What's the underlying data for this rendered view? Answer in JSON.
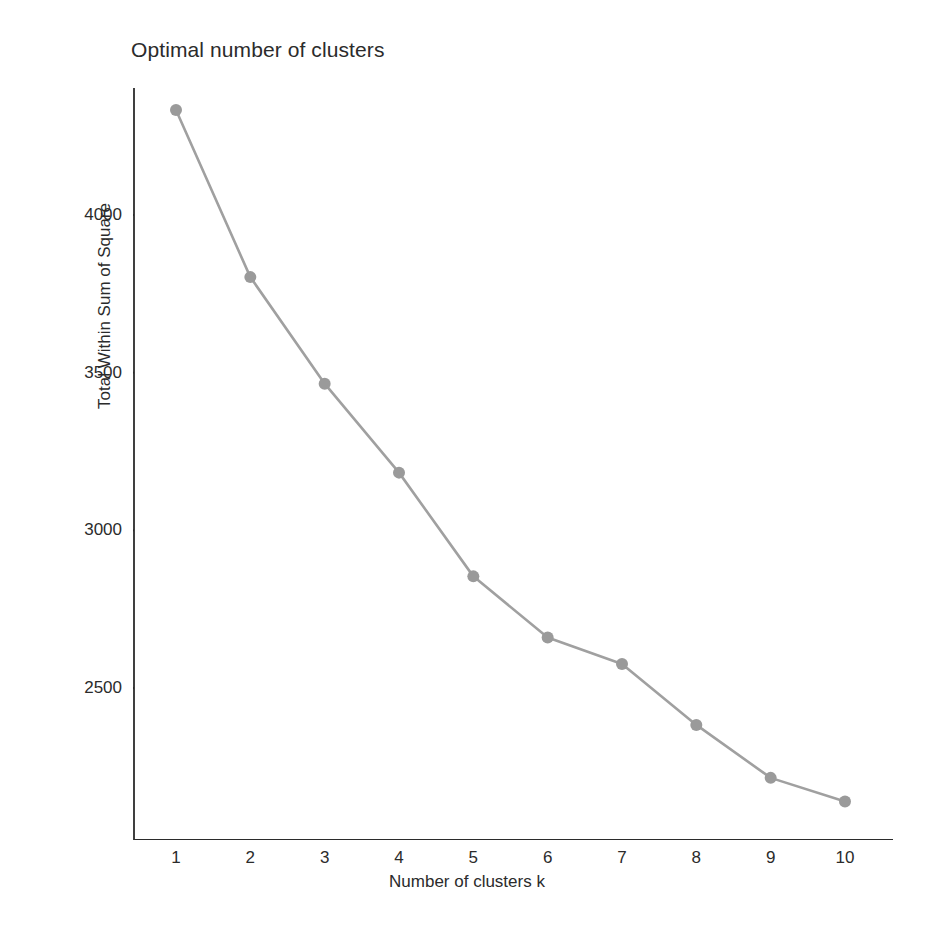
{
  "chart_data": {
    "type": "line",
    "title": "Optimal number of clusters",
    "xlabel": "Number of clusters k",
    "ylabel": "Total Within Sum of Square",
    "x": [
      1,
      2,
      3,
      4,
      5,
      6,
      7,
      8,
      9,
      10
    ],
    "categories": [
      "1",
      "2",
      "3",
      "4",
      "5",
      "6",
      "7",
      "8",
      "9",
      "10"
    ],
    "values": [
      4333,
      3803,
      3465,
      3183,
      2854,
      2660,
      2576,
      2383,
      2215,
      2140
    ],
    "series": [
      {
        "name": "Total Within Sum of Square",
        "values": [
          4333,
          3803,
          3465,
          3183,
          2854,
          2660,
          2576,
          2383,
          2215,
          2140
        ]
      }
    ],
    "x_tick_labels": [
      "1",
      "2",
      "3",
      "4",
      "5",
      "6",
      "7",
      "8",
      "9",
      "10"
    ],
    "y_tick_labels": [
      "2500",
      "3000",
      "3500",
      "4000"
    ],
    "y_tick_values": [
      2500,
      3000,
      3500,
      4000
    ],
    "xlim": [
      0.5,
      10.5
    ],
    "ylim": [
      2065,
      4400
    ],
    "grid": false,
    "legend": "none",
    "line_color": "#a0a0a0",
    "point_color": "#9a9a9a",
    "axis_color": "#2b2b2b",
    "background_color": "#ffffff",
    "marker": "circle",
    "annotations": []
  }
}
